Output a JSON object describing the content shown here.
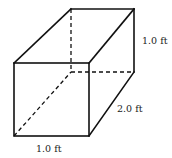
{
  "diagram": {
    "type": "rectangular-prism",
    "labels": {
      "height": "1.0 ft",
      "depth": "2.0 ft",
      "width": "1.0 ft"
    },
    "colors": {
      "line": "#111111",
      "text": "#222222",
      "background": "#ffffff"
    }
  }
}
